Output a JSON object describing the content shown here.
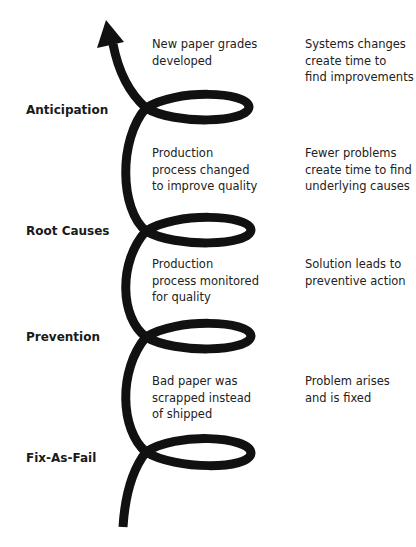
{
  "diagram": {
    "type": "spiral-progression",
    "direction": "bottom-to-top",
    "stroke_color": "#111111",
    "stages": [
      {
        "label": "Anticipation",
        "example": "New paper grades\ndeveloped",
        "driver": "Systems changes\ncreate time to\nfind improvements"
      },
      {
        "label": "Root Causes",
        "example": "Production\nprocess changed\nto improve quality",
        "driver": "Fewer problems\ncreate time to find\nunderlying causes"
      },
      {
        "label": "Prevention",
        "example": "Production\nprocess monitored\nfor quality",
        "driver": "Solution leads to\npreventive action"
      },
      {
        "label": "Fix-As-Fail",
        "example": "Bad paper was\nscrapped instead\nof shipped",
        "driver": "Problem arises\nand is fixed"
      }
    ]
  }
}
